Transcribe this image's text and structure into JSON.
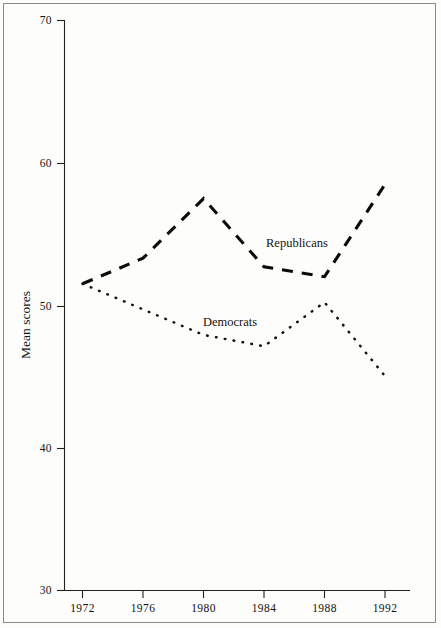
{
  "chart_data": {
    "type": "line",
    "title": "",
    "subtitle": "",
    "xlabel": "",
    "ylabel": "Mean scores",
    "xlim": [
      1971,
      1993
    ],
    "ylim": [
      30,
      70
    ],
    "grid": false,
    "legend_position": "inline-annotations",
    "x": [
      1972,
      1976,
      1980,
      1984,
      1988,
      1992
    ],
    "xticklabels": [
      "1972",
      "1976",
      "1980",
      "1984",
      "1988",
      "1992"
    ],
    "yticks": [
      30,
      40,
      50,
      60,
      70
    ],
    "yticklabels": [
      "30",
      "40",
      "50",
      "60",
      "70"
    ],
    "series": [
      {
        "name": "Republicans",
        "style": "dashed",
        "values": [
          51.6,
          53.4,
          57.6,
          52.8,
          52.1,
          58.6
        ],
        "annotation": "Republicans"
      },
      {
        "name": "Democrats",
        "style": "dotted",
        "values": [
          51.6,
          49.8,
          48.0,
          47.2,
          50.3,
          45.1
        ],
        "annotation": "Democrats"
      }
    ],
    "annotations": [
      {
        "text": "Republicans",
        "x": 1985.1,
        "y": 54.2
      },
      {
        "text": "Democrats",
        "x": 1980.6,
        "y": 48.6
      }
    ],
    "colors": {
      "line": "#15130f",
      "axis": "#22201c",
      "background": "#fdfdfc",
      "frame": "#8a8a86"
    }
  },
  "axes": {
    "y_title": "Mean scores",
    "y_tick_0": "30",
    "y_tick_1": "40",
    "y_tick_2": "50",
    "y_tick_3": "60",
    "y_tick_4": "70",
    "x_tick_0": "1972",
    "x_tick_1": "1976",
    "x_tick_2": "1980",
    "x_tick_3": "1984",
    "x_tick_4": "1988",
    "x_tick_5": "1992"
  },
  "labels": {
    "republicans": "Republicans",
    "democrats": "Democrats"
  }
}
